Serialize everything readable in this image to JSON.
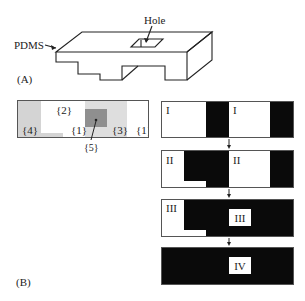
{
  "panel_a": {
    "label": "(A)",
    "material_label": "PDMS",
    "hole_label": "Hole"
  },
  "panel_b": {
    "label": "(B)",
    "layout_map": {
      "regions": [
        {
          "id": "{1}",
          "shade": "white"
        },
        {
          "id": "{1}",
          "shade": "white"
        },
        {
          "id": "{2}",
          "shade": "white"
        },
        {
          "id": "{3}",
          "shade": "light-gray"
        },
        {
          "id": "{4}",
          "shade": "light-gray"
        },
        {
          "id": "{5}",
          "shade": "dark-gray"
        }
      ],
      "labels": {
        "r1a": "{1}",
        "r1b": "{1}",
        "r2": "{2}",
        "r3": "{3}",
        "r4": "{4}",
        "r5": "{5}"
      },
      "colors": {
        "light_gray": "#d4d4d4",
        "dark_gray": "#8f8f8f",
        "border": "#555555"
      }
    },
    "steps": [
      {
        "stage": "I",
        "labels": [
          "I",
          "I"
        ]
      },
      {
        "stage": "II",
        "labels": [
          "II",
          "II"
        ]
      },
      {
        "stage": "III",
        "labels": [
          "III",
          "III"
        ]
      },
      {
        "stage": "IV",
        "labels": [
          "IV"
        ]
      }
    ]
  }
}
